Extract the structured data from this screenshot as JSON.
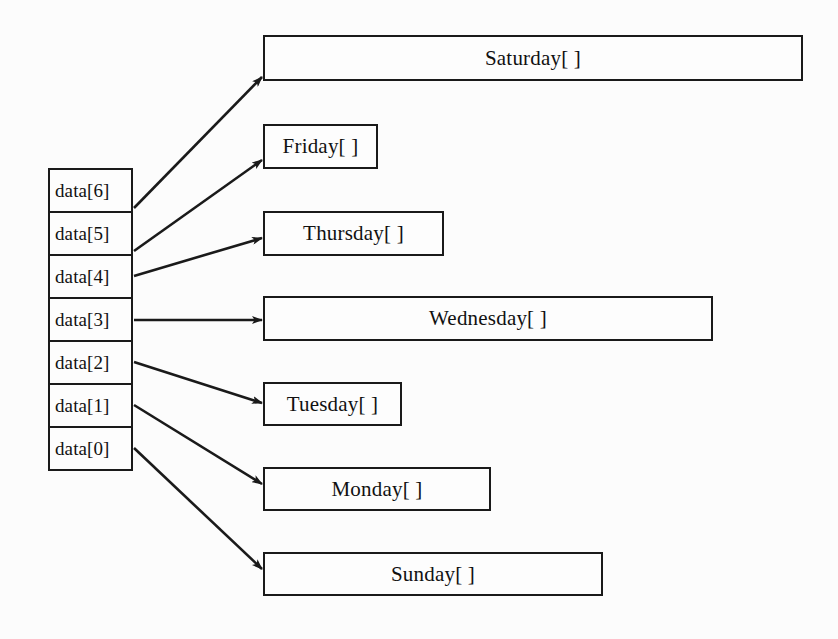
{
  "figure": {
    "type": "array-of-pointers-diagram",
    "background_color": "#fcfcfc",
    "line_color": "#1a1a1a"
  },
  "array": {
    "name": "data",
    "cells": [
      {
        "label": "data[6]",
        "index": 6
      },
      {
        "label": "data[5]",
        "index": 5
      },
      {
        "label": "data[4]",
        "index": 4
      },
      {
        "label": "data[3]",
        "index": 3
      },
      {
        "label": "data[2]",
        "index": 2
      },
      {
        "label": "data[1]",
        "index": 1
      },
      {
        "label": "data[0]",
        "index": 0
      }
    ]
  },
  "targets": [
    {
      "label": "Saturday[ ]",
      "from_index": 6
    },
    {
      "label": "Friday[ ]",
      "from_index": 5
    },
    {
      "label": "Thursday[ ]",
      "from_index": 4
    },
    {
      "label": "Wednesday[ ]",
      "from_index": 3
    },
    {
      "label": "Tuesday[ ]",
      "from_index": 2
    },
    {
      "label": "Monday[ ]",
      "from_index": 1
    },
    {
      "label": "Sunday[ ]",
      "from_index": 0
    }
  ]
}
